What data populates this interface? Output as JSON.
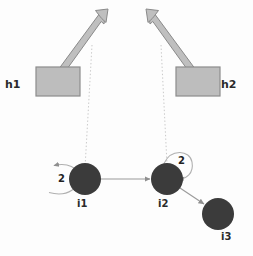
{
  "diagram": {
    "colors": {
      "node_fill": "#3b3b3b",
      "host_fill": "#bdbdbd",
      "host_stroke": "#8c8c8c",
      "arrow_fill": "#bfbfbf",
      "arrow_stroke": "#8a8a8a",
      "edge_stroke": "#9a9a9a",
      "dotted_stroke": "#c9c9c9",
      "loop_stroke": "#b0b0b0",
      "text": "#2b2b2b",
      "background": "#fdfdfd"
    },
    "hosts": [
      {
        "id": "h1",
        "label": "h1",
        "box_x": 36,
        "box_y": 67,
        "box_w": 44,
        "box_h": 29,
        "label_x": 5,
        "label_y": 79
      },
      {
        "id": "h2",
        "label": "h2",
        "box_x": 176,
        "box_y": 67,
        "box_w": 44,
        "box_h": 29,
        "label_x": 221,
        "label_y": 79
      }
    ],
    "block_arrows": [
      {
        "id": "h1-uplink",
        "from_x": 58,
        "from_y": 70,
        "to_x": 103,
        "to_y": 13,
        "direction": "up-right"
      },
      {
        "id": "h2-uplink",
        "from_x": 196,
        "from_y": 70,
        "to_x": 150,
        "to_y": 13,
        "direction": "up-left"
      }
    ],
    "dotted_links": [
      {
        "id": "h1-to-i1",
        "x1": 92,
        "y1": 45,
        "x2": 85,
        "y2": 168
      },
      {
        "id": "h2-to-i2",
        "x1": 161,
        "y1": 45,
        "x2": 167,
        "y2": 164
      }
    ],
    "nodes": [
      {
        "id": "i1",
        "label": "i1",
        "cx": 85,
        "cy": 179,
        "r": 16,
        "label_x": 77,
        "label_y": 199
      },
      {
        "id": "i2",
        "label": "i2",
        "cx": 167,
        "cy": 179,
        "r": 16,
        "label_x": 158,
        "label_y": 199
      },
      {
        "id": "i3",
        "label": "i3",
        "cx": 218,
        "cy": 214,
        "r": 16,
        "label_x": 221,
        "label_y": 232
      }
    ],
    "edges": [
      {
        "id": "i1-to-i2",
        "from": "i1",
        "to": "i2",
        "x1": 101,
        "y1": 179,
        "x2": 150,
        "y2": 179
      },
      {
        "id": "i2-to-i3",
        "from": "i2",
        "to": "i3",
        "x1": 180,
        "y1": 188,
        "x2": 205,
        "y2": 205
      }
    ],
    "self_loops": [
      {
        "id": "i1-self-loop",
        "node": "i1",
        "label": "2",
        "side": "left",
        "label_x": 58,
        "label_y": 175
      },
      {
        "id": "i2-self-loop",
        "node": "i2",
        "label": "2",
        "side": "upper-right",
        "label_x": 178,
        "label_y": 157
      }
    ]
  }
}
